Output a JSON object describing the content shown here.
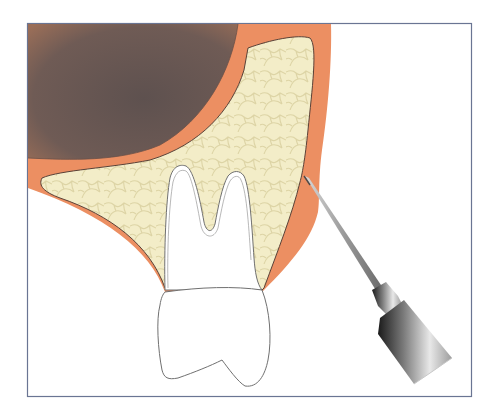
{
  "figure": {
    "title": "Dental injection diagram: needle inserted into buccal mucosa adjacent to maxillary molar",
    "frame": {
      "x": 27,
      "y": 23,
      "width": 445,
      "height": 374,
      "stroke": "#6a7593"
    },
    "colors": {
      "background": "#ffffff",
      "sinus_dark": "#6e5c58",
      "sinus_edge": "#8a6a5c",
      "mucosa": "#ec8f62",
      "bone": "#f2ecc6",
      "bone_texture": "#ddd3a3",
      "bone_outline": "#5a4238",
      "tooth_fill": "#ffffff",
      "tooth_outline": "#707070",
      "needle_shaft": "#a8a8a8",
      "hub_light": "#e6e6e6",
      "hub_dark": "#1c1c1c"
    },
    "parts": [
      {
        "id": "maxillary-sinus",
        "label": "Maxillary sinus"
      },
      {
        "id": "oral-mucosa",
        "label": "Oral mucosa / gingiva"
      },
      {
        "id": "alveolar-bone",
        "label": "Alveolar bone"
      },
      {
        "id": "molar-tooth",
        "label": "Molar tooth (two roots, crown)"
      },
      {
        "id": "injection-needle",
        "label": "Injection needle with hub"
      }
    ]
  }
}
